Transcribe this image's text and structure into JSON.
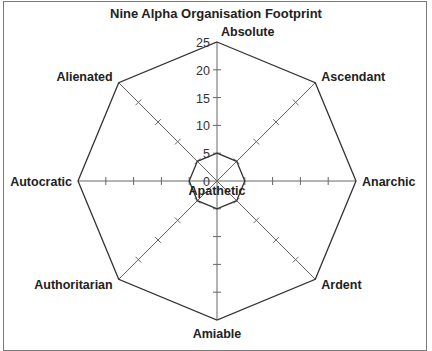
{
  "chart_data": {
    "type": "radar",
    "title": "Nine Alpha Organisation Footprint",
    "axes": [
      "Absolute",
      "Ascendant",
      "Anarchic",
      "Ardent",
      "Amiable",
      "Authoritarian",
      "Autocratic",
      "Alienated"
    ],
    "center_label": "Apathetic",
    "rmax": 25,
    "ticks": [
      0,
      5,
      10,
      15,
      20,
      25
    ],
    "series": [
      {
        "name": "Outer boundary",
        "values": [
          25,
          25,
          25,
          25,
          25,
          25,
          25,
          25
        ]
      },
      {
        "name": "Footprint",
        "values": [
          5,
          5,
          5,
          5,
          5,
          5,
          5,
          5
        ]
      }
    ],
    "grid": false,
    "legend": "none"
  },
  "colors": {
    "line": "#333333",
    "axis": "#666666",
    "frame": "#7a7a7a"
  }
}
